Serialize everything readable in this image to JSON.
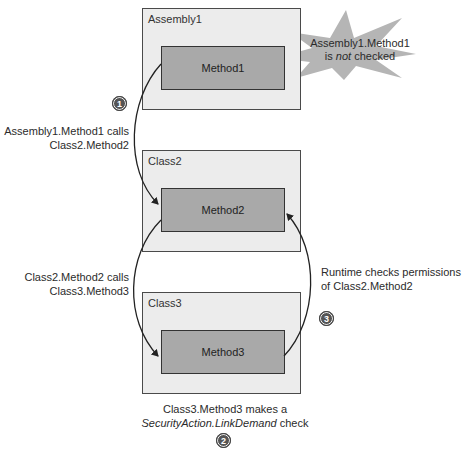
{
  "assembly1": {
    "label": "Assembly1",
    "method": "Method1"
  },
  "class2": {
    "label": "Class2",
    "method": "Method2"
  },
  "class3": {
    "label": "Class3",
    "method": "Method3"
  },
  "callout": {
    "line1": "Assembly1.Method1",
    "line2_pre": "is ",
    "line2_em": "not",
    "line2_post": " checked"
  },
  "steps": {
    "step1": {
      "number": "1",
      "line1": "Assembly1.Method1 calls",
      "line2": "Class2.Method2"
    },
    "step_mid": {
      "line1": "Class2.Method2 calls",
      "line2": "Class3.Method3"
    },
    "step2": {
      "number": "2",
      "line1": "Class3.Method3 makes a",
      "line2_em": "SecurityAction.LinkDemand",
      "line2_post": " check"
    },
    "step3": {
      "number": "3",
      "line1": "Runtime checks permissions",
      "line2": "of Class2.Method2"
    }
  },
  "colors": {
    "container_fill": "#ececec",
    "method_fill": "#a9a9a9",
    "burst_fill": "#b5b5b5",
    "stroke": "#333333"
  }
}
